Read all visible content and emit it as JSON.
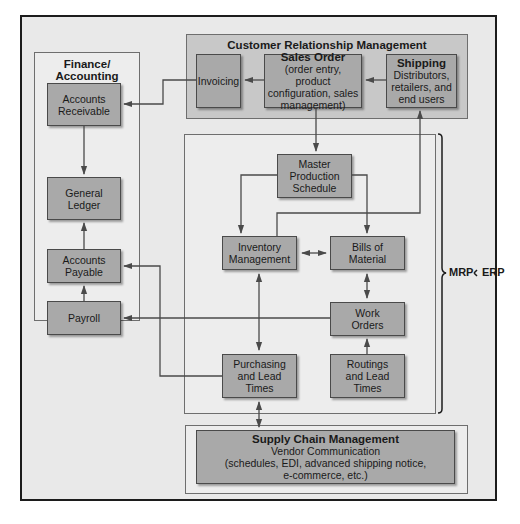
{
  "diagram": {
    "finance": {
      "title": "Finance/ Accounting",
      "nodes": [
        {
          "id": "accounts-receivable",
          "label": "Accounts Receivable"
        },
        {
          "id": "general-ledger",
          "label": "General Ledger"
        },
        {
          "id": "accounts-payable",
          "label": "Accounts Payable"
        },
        {
          "id": "payroll",
          "label": "Payroll"
        }
      ]
    },
    "crm": {
      "title": "Customer Relationship Management",
      "invoicing": "Invoicing",
      "sales_order": {
        "title": "Sales Order",
        "detail": "(order entry, product configuration, sales management)"
      },
      "shipping": {
        "title": "Shipping",
        "detail": "Distributors, retailers, and end users"
      }
    },
    "mrp": {
      "master_production_schedule": "Master Production Schedule",
      "inventory_management": "Inventory Management",
      "bills_of_material": "Bills of Material",
      "work_orders": "Work Orders",
      "purchasing": "Purchasing and Lead Times",
      "routings": "Routings and Lead Times"
    },
    "scm": {
      "title": "Supply Chain Management",
      "line1": "Vendor Communication",
      "line2": "(schedules, EDI, advanced shipping notice,",
      "line3": "e-commerce, etc.)"
    },
    "brackets": {
      "mrp": "MRP",
      "erp": "ERP"
    },
    "colors": {
      "frame_bg": "#e9e9e9",
      "node_fill": "#a9a9a9",
      "panel_dark": "#c8c8c8",
      "line": "#4a4a4a"
    }
  }
}
